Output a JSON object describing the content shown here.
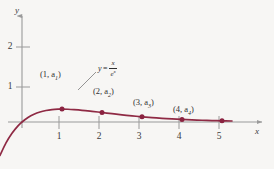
{
  "chart_data": {
    "type": "line",
    "title": "",
    "xlabel": "x",
    "ylabel": "y",
    "xlim": [
      -0.6,
      5.7
    ],
    "ylim": [
      -0.85,
      2.75
    ],
    "grid": false,
    "legend": "none",
    "function_expression": "y = x / e^x",
    "function_numerator": "x",
    "function_denominator_base": "e",
    "function_denominator_exponent": "x",
    "x_ticks": [
      1,
      2,
      3,
      4,
      5
    ],
    "x_tick_labels": [
      "1",
      "2",
      "3",
      "4",
      "5"
    ],
    "y_ticks": [
      1,
      2
    ],
    "y_tick_labels": [
      "1",
      "2"
    ],
    "series": [
      {
        "name": "y = x/e^x",
        "color": "#8f2a44",
        "x": [
          -0.55,
          -0.4,
          -0.25,
          -0.1,
          0,
          0.15,
          0.3,
          0.45,
          0.6,
          0.75,
          0.9,
          1,
          1.15,
          1.3,
          1.5,
          1.75,
          2,
          2.25,
          2.5,
          2.75,
          3,
          3.25,
          3.5,
          3.75,
          4,
          4.25,
          4.5,
          4.75,
          5,
          5.25
        ],
        "y": [
          -0.954,
          -0.597,
          -0.321,
          -0.111,
          0,
          0.129,
          0.222,
          0.287,
          0.329,
          0.354,
          0.366,
          0.368,
          0.364,
          0.354,
          0.335,
          0.304,
          0.271,
          0.237,
          0.205,
          0.176,
          0.149,
          0.126,
          0.106,
          0.088,
          0.073,
          0.06,
          0.05,
          0.041,
          0.034,
          0.028
        ]
      }
    ],
    "markers": [
      {
        "name": "a1",
        "x": 1,
        "y": 0.368,
        "label": "(1, a",
        "sub": "1",
        "label_end": ")",
        "labeled": true
      },
      {
        "name": "a2",
        "x": 2,
        "y": 0.271,
        "label": "(2, a",
        "sub": "2",
        "label_end": ")",
        "labeled": true
      },
      {
        "name": "a3",
        "x": 3,
        "y": 0.149,
        "label": "(3, a",
        "sub": "3",
        "label_end": ")",
        "labeled": true
      },
      {
        "name": "a4",
        "x": 4,
        "y": 0.073,
        "label": "(4, a",
        "sub": "4",
        "label_end": ")",
        "labeled": true
      },
      {
        "name": "a5",
        "x": 5,
        "y": 0.034,
        "label": "",
        "sub": "",
        "label_end": "",
        "labeled": false
      }
    ],
    "annotations": [
      {
        "name": "curve-equation",
        "text": "y = x/e^x",
        "leader_line": true
      }
    ],
    "colors": {
      "curve": "#8f2a44",
      "marker": "#8b2340",
      "axis": "#9a9a9a",
      "text": "#2f2f2f",
      "background": "#f7f6f4"
    }
  },
  "labels": {
    "y_axis_name": "y",
    "x_axis_name": "x",
    "y_tick_1": "1",
    "y_tick_2": "2",
    "x_tick_1": "1",
    "x_tick_2": "2",
    "x_tick_3": "3",
    "x_tick_4": "4",
    "x_tick_5": "5",
    "point1_open": "(1, a",
    "point1_sub": "1",
    "point1_close": ")",
    "point2_open": "(2, a",
    "point2_sub": "2",
    "point2_close": ")",
    "point3_open": "(3, a",
    "point3_sub": "3",
    "point3_close": ")",
    "point4_open": "(4, a",
    "point4_sub": "4",
    "point4_close": ")",
    "eq_lhs": "y",
    "eq_sign": "=",
    "eq_num": "x",
    "eq_den_base": "e",
    "eq_den_exp": "x"
  }
}
